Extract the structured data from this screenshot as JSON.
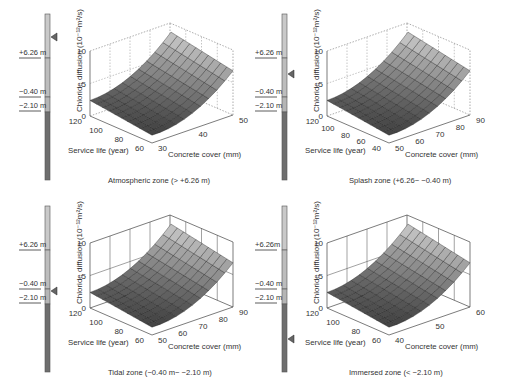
{
  "chart_data": [
    {
      "type": "surface3d",
      "title": "Atmospheric zone (> +6.26 m)",
      "zlabel": "Chloride diffusion (10^-12 m^2/s)",
      "xlabel": "Service life (year)",
      "ylabel": "Concrete cover (mm)",
      "x_ticks": [
        120,
        100,
        80,
        60
      ],
      "y_ticks": [
        30,
        40,
        50
      ],
      "z_ticks": [
        0,
        5,
        10
      ],
      "zlim": [
        0,
        10
      ],
      "surface_range": {
        "min": 1,
        "max": 8.5
      },
      "zone_marker": "atmospheric",
      "gauge_labels": [
        "+6.26 m",
        "-0.40 m",
        "-2.10 m"
      ],
      "marker_position": "above +6.26 m"
    },
    {
      "type": "surface3d",
      "title": "Splash zone (+6.26 - -0.40 m)",
      "zlabel": "Chloride diffusion (10^-12 m^2/s)",
      "xlabel": "Service life (year)",
      "ylabel": "Concrete cover (mm)",
      "x_ticks": [
        120,
        100,
        80,
        60,
        40
      ],
      "y_ticks": [
        50,
        60,
        70,
        80,
        90
      ],
      "z_ticks": [
        0,
        5,
        10
      ],
      "zlim": [
        0,
        10
      ],
      "surface_range": {
        "min": 1,
        "max": 7.5
      },
      "zone_marker": "splash",
      "gauge_labels": [
        "+6.26 m",
        "-0.40 m",
        "-2.10 m"
      ],
      "marker_position": "between +6.26 m and -0.40 m"
    },
    {
      "type": "surface3d",
      "title": "Tidal zone (-0.40 m - -2.10 m)",
      "zlabel": "Chloride diffusion (10^-12 m^2/s)",
      "xlabel": "Service life (year)",
      "ylabel": "Concrete cover (mm)",
      "x_ticks": [
        120,
        100,
        80,
        60
      ],
      "y_ticks": [
        50,
        60,
        70,
        80,
        90
      ],
      "z_ticks": [
        0,
        5,
        10
      ],
      "zlim": [
        0,
        10
      ],
      "surface_range": {
        "min": 1,
        "max": 8.5
      },
      "zone_marker": "tidal",
      "gauge_labels": [
        "+6.26 m",
        "-0.40 m",
        "-2.10 m"
      ],
      "marker_position": "between -0.40 m and -2.10 m"
    },
    {
      "type": "surface3d",
      "title": "Immersed zone (< -2.10 m)",
      "zlabel": "Chloride diffusion (10^-12 m^2/s)",
      "xlabel": "Service life (year)",
      "ylabel": "Concrete cover (mm)",
      "x_ticks": [
        120,
        100,
        80,
        60
      ],
      "y_ticks": [
        40,
        50,
        60
      ],
      "z_ticks": [
        0,
        5,
        10
      ],
      "zlim": [
        0,
        10
      ],
      "surface_range": {
        "min": 1,
        "max": 8.5
      },
      "zone_marker": "immersed",
      "gauge_labels": [
        "+6.26 m",
        "-0.40 m",
        "-2.10 m"
      ],
      "marker_position": "below -2.10 m"
    }
  ],
  "panels": [
    {
      "caption": "Atmospheric zone (> +6.26 m)",
      "zlabel": "Chloride diffusion (10⁻¹²m²/s)",
      "xlabel": "Service life (year)",
      "ylabel": "Concrete cover (mm)",
      "x_ticks": [
        "120",
        "100",
        "80",
        "60"
      ],
      "y_ticks": [
        "30",
        "40",
        "50"
      ],
      "z_ticks": [
        "0",
        "5",
        "10"
      ],
      "gauge": [
        "+6.26 m",
        "−0.40 m",
        "−2.10 m"
      ],
      "marker_y": 37
    },
    {
      "caption": "Splash zone (+6.26− −0.40 m)",
      "zlabel": "Chloride diffusion (10⁻¹²m²/s)",
      "xlabel": "Service life (year)",
      "ylabel": "Concrete cover (mm)",
      "x_ticks": [
        "120",
        "100",
        "80",
        "60",
        "40"
      ],
      "y_ticks": [
        "50",
        "60",
        "70",
        "80",
        "90"
      ],
      "z_ticks": [
        "0",
        "5",
        "10"
      ],
      "gauge": [
        "+6.26 m",
        "−0.40 m",
        "−2.10 m"
      ],
      "marker_y": 74
    },
    {
      "caption": "Tidal zone (−0.40 m− −2.10 m)",
      "zlabel": "Chloride diffusion (10⁻¹²m²/s)",
      "xlabel": "Service life (year)",
      "ylabel": "Concrete cover (mm)",
      "x_ticks": [
        "120",
        "100",
        "80",
        "60"
      ],
      "y_ticks": [
        "50",
        "60",
        "70",
        "80",
        "90"
      ],
      "z_ticks": [
        "0",
        "5",
        "10"
      ],
      "gauge": [
        "+6.26 m",
        "−0.40 m",
        "−2.10 m"
      ],
      "marker_y": 99
    },
    {
      "caption": "Immersed zone (< −2.10 m)",
      "zlabel": "Chloride diffusion (10⁻¹²m²/s)",
      "xlabel": "Service life (year)",
      "ylabel": "Concrete cover (mm)",
      "x_ticks": [
        "120",
        "100",
        "80",
        "60"
      ],
      "y_ticks": [
        "40",
        "50",
        "60"
      ],
      "z_ticks": [
        "0",
        "5",
        "10"
      ],
      "gauge": [
        "+6.26m",
        "−0.40 m",
        "−2.10 m"
      ],
      "marker_y": 147
    }
  ],
  "colors": {
    "gauge_top": "#c9c9c9",
    "gauge_mid": "#b5b5b5",
    "gauge_bottom": "#6e6e6e",
    "surface_dark": "#2a2a2a",
    "surface_light": "#d8d8d8",
    "axis": "#444444",
    "grid": "#888888"
  }
}
